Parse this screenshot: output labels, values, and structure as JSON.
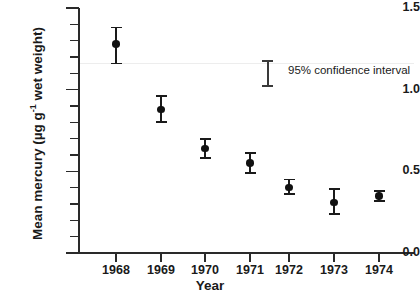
{
  "chart_data": {
    "type": "scatter",
    "title": "",
    "xlabel": "Year",
    "ylabel_plain": "Mean mercury (µg g-1 wet weight)",
    "ylabel_prefix": "Mean mercury  (µg g",
    "ylabel_sup": "-1",
    "ylabel_suffix": " wet weight)",
    "categories": [
      1968,
      1969,
      1970,
      1971,
      1972,
      1973,
      1974
    ],
    "x_tick_labels": [
      "1968",
      "1969",
      "1970",
      "1971",
      "1972",
      "1973",
      "1974"
    ],
    "y_tick_labels": [
      "1.5",
      "1.0",
      "0.5",
      "0.0"
    ],
    "y_tick_values": [
      1.5,
      1.0,
      0.5,
      0.0
    ],
    "y_minor_step": 0.1,
    "ylim": [
      0.0,
      1.5
    ],
    "xlim": [
      1967.5,
      1974.8
    ],
    "grid": false,
    "legend_position": "inside-top-right",
    "error_type": "95% confidence interval",
    "values": [
      1.28,
      0.88,
      0.64,
      0.55,
      0.4,
      0.31,
      0.35
    ],
    "ci_lower": [
      1.16,
      0.8,
      0.58,
      0.49,
      0.36,
      0.24,
      0.32
    ],
    "ci_upper": [
      1.38,
      0.96,
      0.7,
      0.61,
      0.45,
      0.39,
      0.38
    ],
    "series": [
      {
        "name": "Mean mercury",
        "points": [
          {
            "x": 1968,
            "y": 1.28,
            "lo": 1.16,
            "hi": 1.38
          },
          {
            "x": 1969,
            "y": 0.88,
            "lo": 0.8,
            "hi": 0.96
          },
          {
            "x": 1970,
            "y": 0.64,
            "lo": 0.58,
            "hi": 0.7
          },
          {
            "x": 1971,
            "y": 0.55,
            "lo": 0.49,
            "hi": 0.61
          },
          {
            "x": 1972,
            "y": 0.4,
            "lo": 0.36,
            "hi": 0.45
          },
          {
            "x": 1973,
            "y": 0.31,
            "lo": 0.24,
            "hi": 0.39
          },
          {
            "x": 1974,
            "y": 0.35,
            "lo": 0.32,
            "hi": 0.38
          }
        ]
      }
    ],
    "annotations": [
      {
        "text": "95% confidence interval",
        "type": "legend-label"
      }
    ]
  },
  "colors": {
    "marker": "#111111",
    "error_bar": "#1a1a1a",
    "axis": "#2a2a2a",
    "background": "#ffffff",
    "faint_guide": "#ededed"
  },
  "legend": {
    "label": "95% confidence interval"
  }
}
